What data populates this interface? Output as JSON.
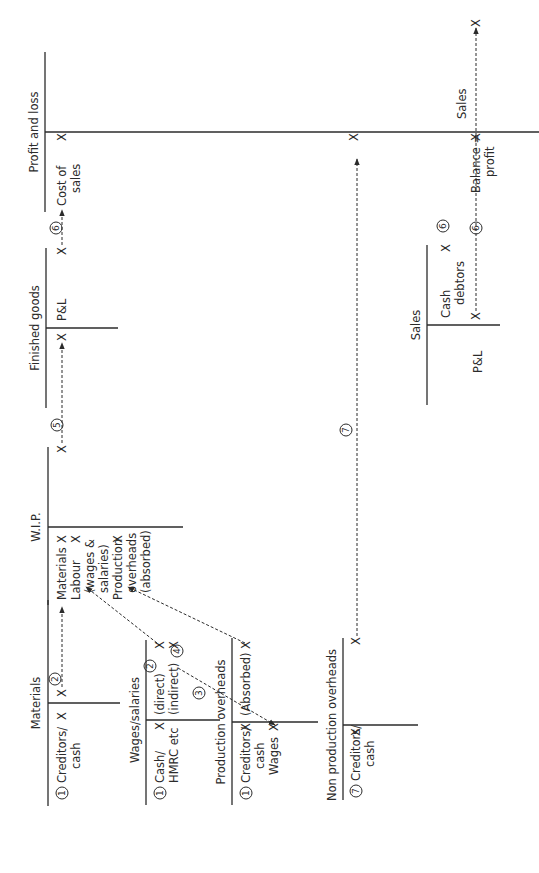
{
  "diagram": {
    "orientation": "rotated 90 degrees counter-clockwise",
    "accounts": {
      "materials": {
        "title": "Materials",
        "debit": [
          {
            "num": "1",
            "label1": "Creditors/",
            "label2": "cash",
            "value": "X"
          }
        ],
        "credit": [
          {
            "num": "2",
            "value": "X"
          }
        ]
      },
      "wages": {
        "title": "Wages/salaries",
        "debit": [
          {
            "num": "1",
            "label1": "Cash/",
            "label2": "HMRC etc",
            "value": "X"
          }
        ],
        "credit": [
          {
            "label": "(direct)",
            "value": "X",
            "num": "2"
          },
          {
            "label": "(indirect)",
            "value": "X",
            "num": "3"
          }
        ]
      },
      "prod_oh": {
        "title": "Production overheads",
        "debit": [
          {
            "num": "1",
            "label1": "Creditors/",
            "label2": "cash",
            "value": "X"
          },
          {
            "label": "Wages",
            "value": "X"
          }
        ],
        "credit": [
          {
            "label": "(Absorbed)",
            "value": "X",
            "num": "4"
          }
        ]
      },
      "nonprod_oh": {
        "title": "Non production overheads",
        "debit": [
          {
            "num": "7",
            "label1": "Creditors/",
            "label2": "cash",
            "value": "X"
          }
        ],
        "credit": [
          {
            "value": "X",
            "num": "7"
          }
        ]
      },
      "wip": {
        "title": "W.I.P.",
        "debit": [
          {
            "label": "Materials",
            "value": "X"
          },
          {
            "label": "Labour",
            "sub1": "(wages &",
            "sub2": "salaries)",
            "value": "X"
          },
          {
            "label": "Production",
            "sub1": "overheads",
            "sub2": "(absorbed)",
            "value": "X"
          }
        ],
        "credit": [
          {
            "value": "X",
            "num": "5"
          }
        ]
      },
      "finished_goods": {
        "title": "Finished goods",
        "debit": [
          {
            "value": "X"
          }
        ],
        "credit": [
          {
            "label": "P&L",
            "value": "X",
            "num": "6"
          }
        ]
      },
      "profit_loss": {
        "title": "Profit and loss",
        "debit": [
          {
            "label1": "Cost of",
            "label2": "sales",
            "value": "X"
          },
          {
            "value": "X"
          },
          {
            "label1": "Balance =",
            "label2": "profit",
            "value": "X"
          }
        ],
        "credit": [
          {
            "label": "Sales",
            "value": "X"
          }
        ]
      },
      "sales": {
        "title": "Sales",
        "debit": [
          {
            "label": "P&L",
            "value": "X",
            "num": "6"
          }
        ],
        "credit": [
          {
            "label1": "Cash",
            "label2": "debtors",
            "value": "X",
            "num": "6"
          }
        ]
      }
    }
  }
}
